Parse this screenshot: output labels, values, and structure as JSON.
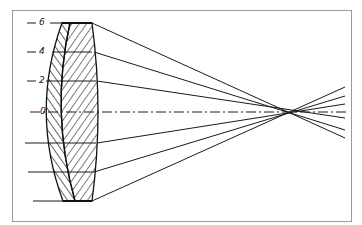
{
  "diagram": {
    "type": "optical lens ray diagram",
    "height_labels": [
      "6",
      "4",
      "2",
      "0"
    ],
    "colors": {
      "line": "#1a1a1a",
      "frame": "#9a9a9a",
      "background": "#ffffff"
    },
    "rays": [
      {
        "height": "6",
        "y_in": 23,
        "y_out": 138
      },
      {
        "height": "4",
        "y_in": 52,
        "y_out": 130
      },
      {
        "height": "2",
        "y_in": 81,
        "y_out": 118
      },
      {
        "height": "-2",
        "y_in": 143,
        "y_out": 104
      },
      {
        "height": "-4",
        "y_in": 172,
        "y_out": 96
      },
      {
        "height": "-6",
        "y_in": 201,
        "y_out": 87
      }
    ]
  }
}
